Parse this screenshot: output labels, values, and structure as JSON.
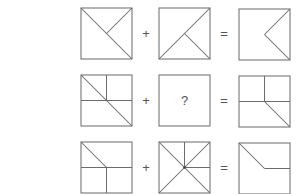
{
  "puzzle": {
    "line_color": "#6b6b6b",
    "rows": [
      {
        "operand_a": {
          "label": ""
        },
        "operator_plus": "+",
        "operand_b": {
          "label": ""
        },
        "operator_equals": "=",
        "result": {
          "label": ""
        }
      },
      {
        "operand_a": {
          "label": ""
        },
        "operator_plus": "+",
        "operand_b": {
          "label": "?"
        },
        "operator_equals": "=",
        "result": {
          "label": ""
        }
      },
      {
        "operand_a": {
          "label": ""
        },
        "operator_plus": "+",
        "operand_b": {
          "label": ""
        },
        "operator_equals": "=",
        "result": {
          "label": ""
        }
      }
    ]
  }
}
